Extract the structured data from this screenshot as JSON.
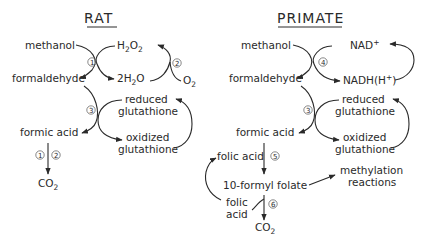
{
  "rat": {
    "title": "RAT",
    "methanol": "methanol",
    "formaldehyde": "formaldehyde",
    "formic_acid": "formic acid",
    "co2": "CO",
    "co2_sub": "2",
    "h2o2_h": "H",
    "h2o2_sub1": "2",
    "h2o2_o": "O",
    "h2o2_sub2": "2",
    "h2o_pre": "2H",
    "h2o_sub": "2",
    "h2o_o": "O",
    "o2": "O",
    "o2_sub": "2",
    "reduced_1": "reduced",
    "reduced_2": "glutathione",
    "oxidized_1": "oxidized",
    "oxidized_2": "glutathione",
    "enzyme_1": "1",
    "enzyme_2": "2",
    "enzyme_3": "3",
    "enzyme_1b": "1",
    "enzyme_2b": "2"
  },
  "primate": {
    "title": "PRIMATE",
    "methanol": "methanol",
    "formaldehyde": "formaldehyde",
    "formic_acid": "formic acid",
    "nad": "NAD",
    "nad_sup": "+",
    "nadh": "NADH(H",
    "nadh_sup": "+",
    "nadh_close": ")",
    "reduced_1": "reduced",
    "reduced_2": "glutathione",
    "oxidized_1": "oxidized",
    "oxidized_2": "glutathione",
    "folic_acid_in": "folic acid",
    "formyl_folate": "10-formyl  folate",
    "methylation_1": "methylation",
    "methylation_2": "reactions",
    "folic_acid_out_1": "folic",
    "folic_acid_out_2": "acid",
    "co2": "CO",
    "co2_sub": "2",
    "enzyme_4": "4",
    "enzyme_3": "3",
    "enzyme_5": "5",
    "enzyme_6": "6"
  }
}
